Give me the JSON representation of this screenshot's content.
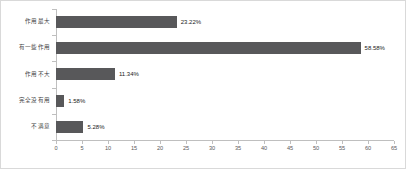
{
  "chart_data": {
    "type": "bar",
    "orientation": "horizontal",
    "title": "",
    "subtitle": "",
    "xlabel": "",
    "ylabel": "",
    "categories": [
      "作用最大",
      "有一些作用",
      "作用不大",
      "完全没有用",
      "不满意"
    ],
    "values": [
      23.22,
      58.58,
      11.34,
      1.58,
      5.28
    ],
    "data_labels": [
      "23.22%",
      "58.58%",
      "11.34%",
      "1.58%",
      "5.28%"
    ],
    "xlim": [
      0,
      65
    ],
    "xticks": [
      0,
      5,
      10,
      15,
      20,
      25,
      30,
      35,
      40,
      45,
      50,
      55,
      60,
      65
    ],
    "xtick_labels": [
      "0",
      "5",
      "10",
      "15",
      "20",
      "25",
      "30",
      "35",
      "40",
      "45",
      "50",
      "55",
      "60",
      "65"
    ],
    "grid": false,
    "legend": false,
    "legend_position": "none",
    "series": [
      {
        "name": "",
        "values": [
          23.22,
          58.58,
          11.34,
          1.58,
          5.28
        ]
      }
    ],
    "colors": {
      "bar": "#58585a",
      "axis": "#bfbfbf",
      "border": "#d9d9d9",
      "label_text": "#404040",
      "value_text": "#1a1a1a",
      "tick_text": "#595959",
      "background": "#ffffff"
    }
  }
}
